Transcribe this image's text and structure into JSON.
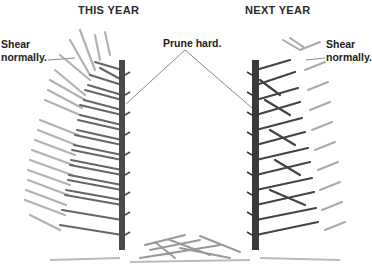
{
  "titles": {
    "left": "THIS YEAR",
    "right": "NEXT YEAR"
  },
  "labels": {
    "left_shear_line1": "Shear",
    "left_shear_line2": "normally.",
    "prune": "Prune hard.",
    "right_shear_line1": "Shear",
    "right_shear_line2": "normally."
  },
  "colors": {
    "trunk": "#4a4a4a",
    "branch_dark": "#555555",
    "branch_light": "#a8a8a8",
    "leader_line": "#555555"
  }
}
